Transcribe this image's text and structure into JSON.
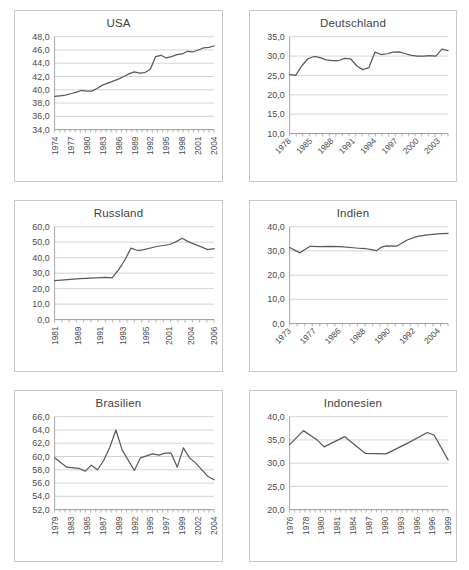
{
  "page": {
    "background": "#ffffff",
    "line_color": "#595959",
    "grid_color": "#c0c0c0",
    "border_color": "#c9c9c9",
    "text_color": "#4a4a4a"
  },
  "charts": [
    {
      "id": "usa",
      "title": "USA",
      "label_orientation": "vertical",
      "chart_data": {
        "type": "line",
        "title": "USA",
        "xlabel": "",
        "ylabel": "",
        "grid": true,
        "legend": "none",
        "ylim": [
          34.0,
          48.0
        ],
        "yticks": [
          "34,0",
          "36,0",
          "38,0",
          "40,0",
          "42,0",
          "44,0",
          "46,0",
          "48,0"
        ],
        "ytick_values": [
          34.0,
          36.0,
          38.0,
          40.0,
          42.0,
          44.0,
          46.0,
          48.0
        ],
        "xtick_labels": [
          "1974",
          "1977",
          "1980",
          "1983",
          "1986",
          "1989",
          "1992",
          "1995",
          "1998",
          "2001",
          "2004"
        ],
        "xtick_step": 3,
        "x": [
          1974,
          1975,
          1976,
          1977,
          1978,
          1979,
          1980,
          1981,
          1982,
          1983,
          1984,
          1985,
          1986,
          1987,
          1988,
          1989,
          1990,
          1991,
          1992,
          1993,
          1994,
          1995,
          1996,
          1997,
          1998,
          1999,
          2000,
          2001,
          2002,
          2003,
          2004
        ],
        "values": [
          39.0,
          39.1,
          39.2,
          39.4,
          39.6,
          39.9,
          39.8,
          39.8,
          40.2,
          40.7,
          41.0,
          41.3,
          41.6,
          42.0,
          42.4,
          42.7,
          42.5,
          42.6,
          43.1,
          45.0,
          45.2,
          44.8,
          45.0,
          45.3,
          45.4,
          45.8,
          45.7,
          46.0,
          46.3,
          46.4,
          46.6
        ]
      }
    },
    {
      "id": "deutschland",
      "title": "Deutschland",
      "label_orientation": "diagonal",
      "chart_data": {
        "type": "line",
        "title": "Deutschland",
        "xlabel": "",
        "ylabel": "",
        "grid": true,
        "legend": "none",
        "ylim": [
          10.0,
          35.0
        ],
        "yticks": [
          "10,0",
          "15,0",
          "20,0",
          "25,0",
          "30,0",
          "35,0"
        ],
        "ytick_values": [
          10.0,
          15.0,
          20.0,
          25.0,
          30.0,
          35.0
        ],
        "xtick_labels": [
          "1978",
          "1985",
          "1988",
          "1991",
          "1994",
          "1997",
          "2000",
          "2003"
        ],
        "x": [
          1978,
          1979,
          1980,
          1981,
          1982,
          1983,
          1984,
          1985,
          1986,
          1987,
          1988,
          1989,
          1990,
          1991,
          1992,
          1993,
          1994,
          1995,
          1996,
          1997,
          1998,
          1999,
          2000,
          2001,
          2002,
          2003,
          2004
        ],
        "values": [
          25.2,
          25.0,
          27.5,
          29.3,
          29.9,
          29.6,
          29.0,
          28.8,
          28.8,
          29.4,
          29.3,
          27.5,
          26.5,
          27.0,
          31.0,
          30.4,
          30.6,
          31.0,
          31.1,
          30.6,
          30.2,
          30.0,
          30.0,
          30.1,
          30.0,
          31.8,
          31.4
        ]
      }
    },
    {
      "id": "russland",
      "title": "Russland",
      "label_orientation": "vertical",
      "chart_data": {
        "type": "line",
        "title": "Russland",
        "xlabel": "",
        "ylabel": "",
        "grid": true,
        "legend": "none",
        "ylim": [
          0.0,
          60.0
        ],
        "yticks": [
          "0,0",
          "10,0",
          "20,0",
          "30,0",
          "40,0",
          "50,0",
          "60,0"
        ],
        "ytick_values": [
          0.0,
          10.0,
          20.0,
          30.0,
          40.0,
          50.0,
          60.0
        ],
        "xtick_labels": [
          "1981",
          "1989",
          "1991",
          "1993",
          "1995",
          "2001",
          "2004",
          "2006"
        ],
        "x": [
          1981,
          1985,
          1989,
          1990,
          1991,
          1992,
          1993,
          1994,
          1995,
          1997,
          1999,
          2000,
          2001,
          2002,
          2004,
          2005,
          2006
        ],
        "values": [
          25.2,
          26.5,
          27.2,
          26.9,
          32.0,
          38.5,
          46.2,
          44.6,
          45.2,
          47.2,
          48.5,
          50.2,
          52.5,
          50.2,
          47.0,
          45.2,
          45.8
        ]
      }
    },
    {
      "id": "indien",
      "title": "Indien",
      "label_orientation": "diagonal",
      "chart_data": {
        "type": "line",
        "title": "Indien",
        "xlabel": "",
        "ylabel": "",
        "grid": true,
        "legend": "none",
        "ylim": [
          0.0,
          40.0
        ],
        "yticks": [
          "0,0",
          "10,0",
          "20,0",
          "30,0",
          "40,0"
        ],
        "ytick_values": [
          0.0,
          10.0,
          20.0,
          30.0,
          40.0
        ],
        "xtick_labels": [
          "1973",
          "1977",
          "1986",
          "1988",
          "1990",
          "1992",
          "2004"
        ],
        "x": [
          1973,
          1975,
          1977,
          1979,
          1981,
          1983,
          1986,
          1987,
          1988,
          1989,
          1990,
          1991,
          1992,
          1994,
          1996,
          1998,
          2000,
          2002,
          2004
        ],
        "values": [
          31.4,
          29.2,
          31.9,
          31.8,
          31.9,
          31.8,
          31.2,
          31.0,
          30.9,
          30.5,
          30.1,
          31.6,
          32.1,
          32.0,
          34.5,
          36.0,
          36.6,
          37.0,
          37.2
        ]
      }
    },
    {
      "id": "brasilien",
      "title": "Brasilien",
      "label_orientation": "vertical",
      "chart_data": {
        "type": "line",
        "title": "Brasilien",
        "xlabel": "",
        "ylabel": "",
        "grid": true,
        "legend": "none",
        "ylim": [
          52.0,
          66.0
        ],
        "yticks": [
          "52,0",
          "54,0",
          "56,0",
          "58,0",
          "60,0",
          "62,0",
          "64,0",
          "66,0"
        ],
        "ytick_values": [
          52.0,
          54.0,
          56.0,
          58.0,
          60.0,
          62.0,
          64.0,
          66.0
        ],
        "xtick_labels": [
          "1979",
          "1983",
          "1985",
          "1987",
          "1989",
          "1992",
          "1995",
          "1997",
          "1999",
          "2002",
          "2004"
        ],
        "x": [
          1979,
          1981,
          1983,
          1984,
          1985,
          1986,
          1987,
          1988,
          1989,
          1990,
          1992,
          1993,
          1995,
          1996,
          1997,
          1998,
          1999,
          2000,
          2001,
          2002,
          2004,
          2005
        ],
        "values": [
          59.8,
          58.4,
          58.2,
          57.8,
          58.7,
          58.0,
          59.4,
          61.4,
          64.0,
          61.0,
          57.9,
          59.8,
          60.4,
          60.2,
          60.5,
          60.5,
          58.4,
          61.3,
          59.8,
          59.0,
          57.0,
          56.5
        ]
      }
    },
    {
      "id": "indonesien",
      "title": "Indonesien",
      "label_orientation": "vertical",
      "chart_data": {
        "type": "line",
        "title": "Indonesien",
        "xlabel": "",
        "ylabel": "",
        "grid": true,
        "legend": "none",
        "ylim": [
          20.0,
          40.0
        ],
        "yticks": [
          "20,0",
          "25,0",
          "30,0",
          "35,0",
          "40,0"
        ],
        "ytick_values": [
          20.0,
          25.0,
          30.0,
          35.0,
          40.0
        ],
        "xtick_labels": [
          "1976",
          "1978",
          "1980",
          "1981",
          "1984",
          "1987",
          "1990",
          "1993",
          "1996",
          "1996",
          "1999"
        ],
        "x": [
          1976,
          1978,
          1980,
          1981,
          1984,
          1987,
          1990,
          1993,
          1996,
          1997,
          1999
        ],
        "values": [
          34.0,
          37.0,
          35.0,
          33.5,
          35.7,
          32.1,
          32.0,
          34.2,
          36.6,
          36.0,
          30.7
        ]
      }
    }
  ]
}
